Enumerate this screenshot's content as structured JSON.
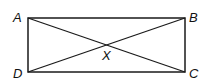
{
  "diagram": {
    "type": "rectangle-with-diagonals",
    "vertices": [
      {
        "label": "A",
        "x": 28,
        "y": 18
      },
      {
        "label": "B",
        "x": 185,
        "y": 18
      },
      {
        "label": "C",
        "x": 185,
        "y": 72
      },
      {
        "label": "D",
        "x": 28,
        "y": 72
      }
    ],
    "intersection": {
      "label": "X",
      "x": 106,
      "y": 45
    },
    "diagonals": [
      "AC",
      "BD"
    ],
    "stroke_color": "#1a1a1a"
  }
}
